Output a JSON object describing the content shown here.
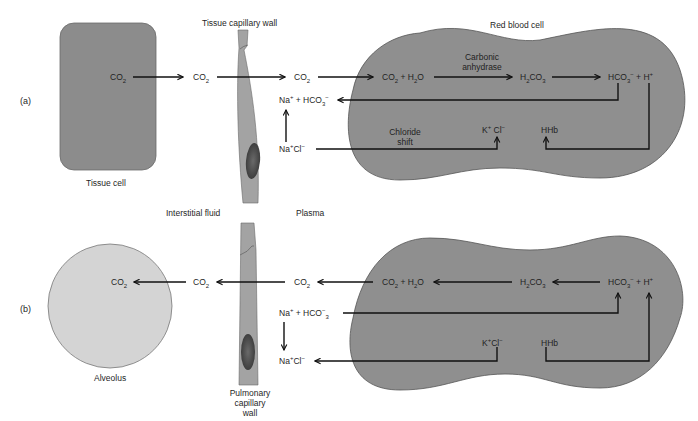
{
  "panels": {
    "a": {
      "label": "(a)",
      "tissue_cell": {
        "label": "Tissue cell",
        "co2": "CO",
        "co2_sub": "2",
        "color": "#8c8c8c"
      },
      "capillary_wall_label": "Tissue capillary wall",
      "interstitial_co2": {
        "base": "CO",
        "sub": "2"
      },
      "plasma_co2": {
        "base": "CO",
        "sub": "2"
      },
      "plasma_na_hco3": {
        "a": "Na",
        "a_sup": "+",
        "b": " + HCO",
        "b_sub": "3",
        "b_sup": "−"
      },
      "plasma_nacl": {
        "a": "Na",
        "a_sup": "+",
        "b": "Cl",
        "b_sup": "−"
      },
      "rbc": {
        "label": "Red blood cell",
        "co2_h2o": {
          "a": "CO",
          "a_sub": "2",
          "b": " + H",
          "b_sub": "2",
          "c": "O"
        },
        "enzyme_line1": "Carbonic",
        "enzyme_line2": "anhydrase",
        "h2co3": {
          "a": "H",
          "a_sub": "2",
          "b": "CO",
          "b_sub": "3"
        },
        "hco3_h": {
          "a": "HCO",
          "a_sub": "3",
          "a_sup": "−",
          "b": " + H",
          "b_sup": "+"
        },
        "chloride_shift_line1": "Chloride",
        "chloride_shift_line2": "shift",
        "kcl": {
          "a": "K",
          "a_sup": "+",
          "b": " Cl",
          "b_sup": "−"
        },
        "hhb": "HHb",
        "color": "#8f8f8f"
      }
    },
    "b": {
      "label": "(b)",
      "interstitial_label": "Interstitial fluid",
      "plasma_label": "Plasma",
      "alveolus": {
        "label": "Alveolus",
        "co2": "CO",
        "co2_sub": "2",
        "color": "#d4d4d4"
      },
      "capillary_wall_label_line1": "Pulmonary",
      "capillary_wall_label_line2": "capillary",
      "capillary_wall_label_line3": "wall",
      "interstitial_co2": {
        "base": "CO",
        "sub": "2"
      },
      "plasma_co2": {
        "base": "CO",
        "sub": "2"
      },
      "plasma_na_hco3": {
        "a": "Na",
        "a_sup": "+",
        "b": " + HCO",
        "b_sup": "−",
        "b_sub": "3"
      },
      "plasma_nacl": {
        "a": "Na",
        "a_sup": "+",
        "b": "Cl",
        "b_sup": "−"
      },
      "rbc": {
        "co2_h2o": {
          "a": "CO",
          "a_sub": "2",
          "b": " + H",
          "b_sub": "2",
          "c": "O"
        },
        "h2co3": {
          "a": "H",
          "a_sub": "2",
          "b": "CO",
          "b_sub": "3"
        },
        "hco3_h": {
          "a": "HCO",
          "a_sub": "3",
          "a_sup": "−",
          "b": " + H",
          "b_sup": "+"
        },
        "kcl": {
          "a": "K",
          "a_sup": "+",
          "b": "Cl",
          "b_sup": "−"
        },
        "hhb": "HHb",
        "color": "#8f8f8f"
      }
    }
  },
  "colors": {
    "capillary_wall": "#a3a3a3",
    "nucleus": "#4a4a4a",
    "arrow": "#111111",
    "outline": "#555555"
  }
}
